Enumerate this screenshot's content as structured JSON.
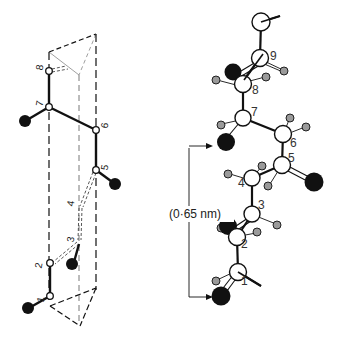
{
  "figure": {
    "left_model": {
      "name": "Skeletal model in prism projection",
      "atom_labels": [
        "1",
        "2",
        "3",
        "4",
        "5",
        "6",
        "7",
        "8"
      ]
    },
    "right_model": {
      "name": "Ball-and-stick model",
      "atom_labels": [
        "1",
        "2",
        "3",
        "4",
        "5",
        "6",
        "7",
        "8",
        "9"
      ]
    },
    "dimension": {
      "label": "(0·65 nm)"
    },
    "colors": {
      "background": "#ffffff",
      "bond": "#111111",
      "heavy_atom": "#111111",
      "hydrogen": "#9a9a9a",
      "carbon_fill": "#ffffff"
    }
  }
}
